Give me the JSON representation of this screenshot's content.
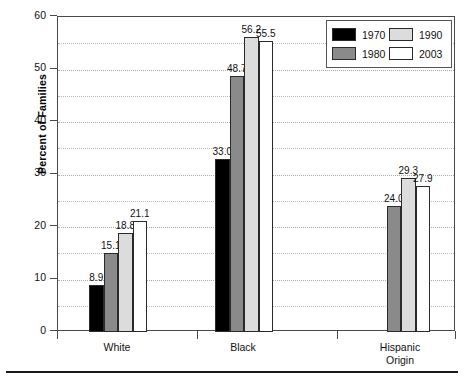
{
  "chart_data": {
    "type": "bar",
    "title": "",
    "xlabel": "",
    "ylabel": "Percent of Families",
    "ylim": [
      0,
      60
    ],
    "yticks": [
      0,
      10,
      20,
      30,
      40,
      50,
      60
    ],
    "ytick_labels": [
      "0",
      "10",
      "20",
      "30",
      "40",
      "50",
      "60"
    ],
    "minor_gridlines": [
      5,
      15,
      25,
      35,
      45,
      55
    ],
    "grid": true,
    "legend_position": "top-right",
    "categories": [
      "White",
      "Black",
      "Hispanic Origin"
    ],
    "series": [
      {
        "name": "1970",
        "color": "#000000",
        "values": [
          8.9,
          33.0,
          null
        ]
      },
      {
        "name": "1980",
        "color": "#8a8a8a",
        "values": [
          15.1,
          48.7,
          24.0
        ]
      },
      {
        "name": "1990",
        "color": "#dcdcdc",
        "values": [
          18.8,
          56.2,
          29.3
        ]
      },
      {
        "name": "2003",
        "color": "#ffffff",
        "values": [
          21.1,
          55.5,
          27.9
        ]
      }
    ],
    "data_labels": {
      "White": [
        "8.9",
        "15.1",
        "18.8",
        "21.1"
      ],
      "Black": [
        "33.0",
        "48.7",
        "56.2",
        "55.5"
      ],
      "Hispanic Origin": [
        "",
        "24.0",
        "29.3",
        "27.9"
      ]
    }
  },
  "legend": {
    "items": [
      {
        "label": "1970",
        "color": "#000000"
      },
      {
        "label": "1990",
        "color": "#dcdcdc"
      },
      {
        "label": "1980",
        "color": "#8a8a8a"
      },
      {
        "label": "2003",
        "color": "#ffffff"
      }
    ]
  },
  "axis": {
    "y_label": "Percent of Families",
    "y_ticks": [
      "60",
      "50",
      "40",
      "30",
      "20",
      "10",
      "0"
    ],
    "x_groups": [
      {
        "line1": "White",
        "line2": ""
      },
      {
        "line1": "Black",
        "line2": ""
      },
      {
        "line1": "Hispanic",
        "line2": "Origin"
      }
    ]
  }
}
